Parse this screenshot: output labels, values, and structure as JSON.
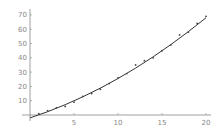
{
  "chart_data": {
    "type": "scatter",
    "title": "",
    "xlabel": "",
    "ylabel": "",
    "xlim": [
      0,
      20.5
    ],
    "ylim": [
      -3,
      72
    ],
    "grid": false,
    "legend": null,
    "x_ticks": [
      5,
      10,
      15,
      20
    ],
    "y_ticks": [
      10,
      20,
      30,
      40,
      50,
      60,
      70
    ],
    "series": [
      {
        "name": "data",
        "kind": "points",
        "x": [
          1,
          2,
          3,
          4,
          5,
          6,
          7,
          8,
          9,
          10,
          11,
          12,
          13,
          14,
          15,
          16,
          17,
          18,
          19,
          20
        ],
        "y": [
          1,
          3,
          5,
          6,
          9,
          13,
          15,
          18,
          22,
          26,
          29,
          35,
          38,
          40,
          45,
          49,
          56,
          58,
          64,
          69
        ]
      },
      {
        "name": "fit",
        "kind": "curve",
        "x": [
          0,
          2,
          4,
          6,
          8,
          10,
          12,
          14,
          16,
          18,
          20
        ],
        "y": [
          -2,
          2.3,
          7.2,
          12.7,
          18.8,
          25.5,
          32.8,
          40.7,
          49.2,
          58.3,
          68
        ]
      }
    ]
  },
  "colors": {
    "axis": "#888888",
    "curve": "#333333",
    "points": "#444444"
  }
}
